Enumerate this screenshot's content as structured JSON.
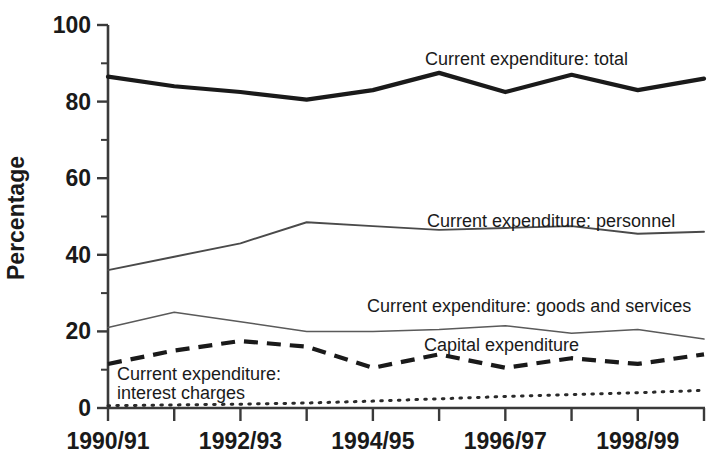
{
  "chart_data": {
    "type": "line",
    "title": "",
    "xlabel": "",
    "ylabel": "Percentage",
    "ylim": [
      0,
      100
    ],
    "grid": false,
    "legend_position": "inline-annotations",
    "x": [
      "1990/91",
      "1991/92",
      "1992/93",
      "1993/94",
      "1994/95",
      "1995/96",
      "1996/97",
      "1997/98",
      "1998/99",
      "1999/00"
    ],
    "x_tick_labels_visible": [
      "1990/91",
      "",
      "1992/93",
      "",
      "1994/95",
      "",
      "1996/97",
      "",
      "1998/99",
      ""
    ],
    "y_tick_labels": [
      "0",
      "20",
      "40",
      "60",
      "80",
      "100"
    ],
    "y_ticks_major": [
      0,
      20,
      40,
      60,
      80,
      100
    ],
    "y_ticks_minor": [
      10,
      30,
      50,
      70,
      90
    ],
    "series": [
      {
        "name": "Current expenditure: total",
        "style": "solid-thick",
        "values": [
          86.5,
          84.0,
          82.5,
          80.5,
          83.0,
          87.5,
          82.5,
          87.0,
          83.0,
          86.0
        ]
      },
      {
        "name": "Current expenditure: personnel",
        "style": "solid-thin",
        "values": [
          36.0,
          39.5,
          43.0,
          48.5,
          47.5,
          46.5,
          47.0,
          47.5,
          45.5,
          46.0
        ]
      },
      {
        "name": "Current expenditure: goods and services",
        "style": "solid-hairline",
        "values": [
          21.0,
          25.0,
          22.5,
          20.0,
          20.0,
          20.5,
          21.5,
          19.5,
          20.5,
          18.0
        ]
      },
      {
        "name": "Capital expenditure",
        "style": "dashed",
        "values": [
          11.5,
          15.0,
          17.5,
          16.0,
          10.5,
          14.0,
          10.5,
          13.0,
          11.5,
          14.0
        ]
      },
      {
        "name": "Current expenditure: interest charges",
        "style": "dotted",
        "values": [
          0.6,
          0.8,
          1.0,
          1.3,
          1.8,
          2.4,
          3.0,
          3.5,
          4.0,
          4.6
        ]
      }
    ],
    "annotations": [
      {
        "text": "Current expenditure: total",
        "series": "Current expenditure: total"
      },
      {
        "text": "Current expenditure: personnel",
        "series": "Current expenditure: personnel"
      },
      {
        "text": "Current expenditure: goods and services",
        "series": "Current expenditure: goods and services"
      },
      {
        "text": "Capital expenditure",
        "series": "Capital expenditure"
      },
      {
        "text": "Current expenditure:",
        "series": "Current expenditure: interest charges"
      },
      {
        "text": "interest charges",
        "series": "Current expenditure: interest charges"
      }
    ]
  },
  "axis": {
    "y_label": "Percentage",
    "y_ticks": [
      "100",
      "80",
      "60",
      "40",
      "20",
      "0"
    ],
    "x_ticks": [
      "1990/91",
      "1992/93",
      "1994/95",
      "1996/97",
      "1998/99"
    ]
  },
  "labels": {
    "total": "Current expenditure: total",
    "personnel": "Current expenditure: personnel",
    "goods": "Current expenditure: goods and services",
    "capital": "Capital expenditure",
    "interest_line1": "Current expenditure:",
    "interest_line2": "interest charges"
  },
  "colors": {
    "ink": "#1a1a1a",
    "axis": "#3a3a3a",
    "thin_line": "#4a4a4a",
    "background": "#ffffff"
  }
}
